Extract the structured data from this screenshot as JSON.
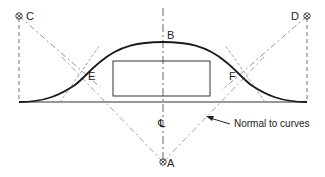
{
  "diagram": {
    "type": "geometric construction — reverse curve / ogee over rectangle",
    "points": {
      "A": {
        "label": "A",
        "x": 163,
        "y": 162,
        "marker": "center-point"
      },
      "B": {
        "label": "B",
        "x": 163,
        "y": 42
      },
      "C": {
        "label": "C",
        "x": 19,
        "y": 16,
        "marker": "center-point"
      },
      "D": {
        "label": "D",
        "x": 307,
        "y": 16,
        "marker": "center-point"
      },
      "E": {
        "label": "E",
        "x": 88,
        "y": 75
      },
      "F": {
        "label": "F",
        "x": 235,
        "y": 75
      }
    },
    "centerline_label": "℄",
    "annotation": "Normal to curves",
    "colors": {
      "curve": "#1a1a1a",
      "construction": "#777777",
      "baseline": "#333333",
      "background": "#ffffff"
    }
  }
}
